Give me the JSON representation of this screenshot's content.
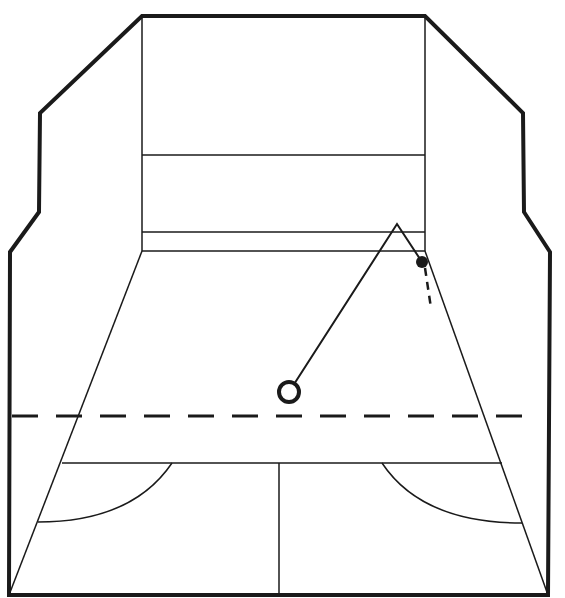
{
  "diagram": {
    "type": "squash-court-perspective",
    "colors": {
      "line": "#1a1a1a",
      "background": "#ffffff"
    },
    "outline": [
      [
        142,
        16
      ],
      [
        425,
        16
      ],
      [
        523,
        113
      ],
      [
        524,
        212
      ],
      [
        550,
        252
      ],
      [
        548,
        595
      ],
      [
        9,
        595
      ],
      [
        10,
        252
      ],
      [
        39,
        212
      ],
      [
        40,
        113
      ]
    ],
    "front_wall": {
      "x1": 142,
      "x2": 425,
      "top": 16,
      "bottom": 251,
      "service_line_y": 155,
      "tin_top_y": 232
    },
    "floor": {
      "back_left": [
        142,
        251
      ],
      "back_right": [
        425,
        251
      ],
      "front_left": [
        9,
        595
      ],
      "front_right": [
        548,
        595
      ]
    },
    "short_line": {
      "y": 463,
      "x1": 62,
      "x2": 502
    },
    "half_court_line": {
      "x": 279,
      "y1": 463,
      "y2": 595
    },
    "service_boxes": {
      "left_arc": {
        "start": [
          172,
          463
        ],
        "end": [
          38,
          522
        ]
      },
      "right_arc": {
        "start": [
          382,
          463
        ],
        "end": [
          522,
          523
        ]
      }
    },
    "dashed_line": {
      "y": 416,
      "x1": 12,
      "x2": 535
    },
    "shot_path": {
      "start": [
        289,
        392
      ],
      "front_wall_hit": [
        397,
        224
      ],
      "ball_position": [
        422,
        262
      ],
      "continuation_dashed": [
        [
          425,
          268
        ],
        [
          431,
          308
        ]
      ]
    },
    "player_marker": {
      "cx": 289,
      "cy": 392,
      "r": 10
    },
    "ball": {
      "cx": 422,
      "cy": 262,
      "r": 6
    }
  }
}
